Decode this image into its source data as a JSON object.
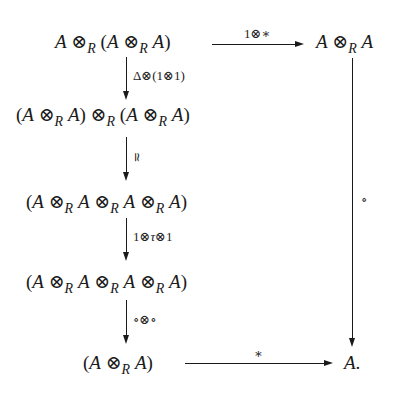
{
  "diagram": {
    "type": "commutative-diagram",
    "nodes": {
      "top_left": {
        "text": "A ⊗R (A ⊗R A)",
        "parts": [
          "A",
          " ⊗",
          "R",
          " (",
          "A",
          " ⊗",
          "R",
          " ",
          "A",
          ")"
        ]
      },
      "top_right": {
        "text": "A ⊗R A",
        "parts": [
          "A",
          " ⊗",
          "R",
          " ",
          "A"
        ]
      },
      "row2": {
        "text": "(A ⊗R A) ⊗R (A ⊗R A)",
        "parts": [
          "(",
          "A",
          " ⊗",
          "R",
          " ",
          "A",
          ") ⊗",
          "R",
          " (",
          "A",
          " ⊗",
          "R",
          " ",
          "A",
          ")"
        ]
      },
      "row3": {
        "text": "(A ⊗R A ⊗R A ⊗R A)",
        "parts": [
          "(",
          "A",
          " ⊗",
          "R",
          " ",
          "A",
          " ⊗",
          "R",
          " ",
          "A",
          " ⊗",
          "R",
          " ",
          "A",
          ")"
        ]
      },
      "row4": {
        "text": "(A ⊗R A ⊗R A ⊗R A)",
        "parts": [
          "(",
          "A",
          " ⊗",
          "R",
          " ",
          "A",
          " ⊗",
          "R",
          " ",
          "A",
          " ⊗",
          "R",
          " ",
          "A",
          ")"
        ]
      },
      "bottom_left": {
        "text": "(A ⊗R A)",
        "parts": [
          "(",
          "A",
          " ⊗",
          "R",
          " ",
          "A",
          ")"
        ]
      },
      "bottom_right": {
        "text": "A.",
        "parts": [
          "A",
          "."
        ]
      }
    },
    "arrows": {
      "top": {
        "from": "top_left",
        "to": "top_right",
        "label": "1⊗∗"
      },
      "left1": {
        "from": "top_left",
        "to": "row2",
        "label": "Δ⊗(1⊗1)"
      },
      "left2": {
        "from": "row2",
        "to": "row3",
        "label": "≃"
      },
      "left3": {
        "from": "row3",
        "to": "row4",
        "label_parts": [
          "1⊗",
          "τ",
          "⊗1"
        ],
        "label": "1⊗τ⊗1"
      },
      "left4": {
        "from": "row4",
        "to": "bottom_left",
        "label": "∘⊗∘"
      },
      "right": {
        "from": "top_right",
        "to": "bottom_right",
        "label": "∘"
      },
      "bottom": {
        "from": "bottom_left",
        "to": "bottom_right",
        "label": "∗"
      }
    }
  }
}
